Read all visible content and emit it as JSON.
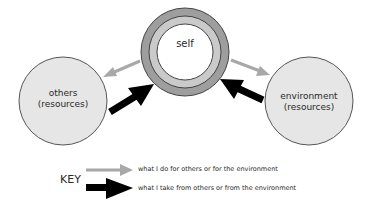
{
  "nodes": {
    "self": {
      "label": "self"
    },
    "others": {
      "line1": "others",
      "line2": "(resources)"
    },
    "environment": {
      "line1": "environment",
      "line2": "(resources)"
    }
  },
  "key": {
    "title": "KEY",
    "items": [
      {
        "arrow": "gray-thin-arrow",
        "color": "#a8a8a8",
        "label": "what I do for others or for the environment"
      },
      {
        "arrow": "black-bold-arrow",
        "color": "#000000",
        "label": "what I take from others or from the environment"
      }
    ]
  },
  "colors": {
    "resource_circle_fill": "#e6e6e6",
    "self_outer_ring": "#9e9e9e",
    "self_inner_ring": "#cacaca",
    "give_arrow": "#a8a8a8",
    "take_arrow": "#000000"
  }
}
